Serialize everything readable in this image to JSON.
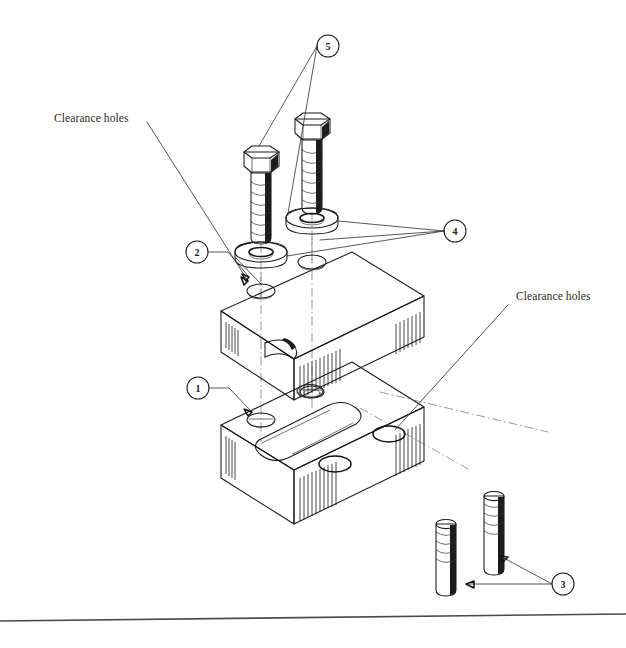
{
  "drawing": {
    "title": "Exploded isometric assembly drawing",
    "canvas": {
      "width": 626,
      "height": 648
    },
    "background_color": "#ffffff",
    "line_color": "#1a1a1a",
    "annotations": [
      {
        "id": "clearance-holes-left",
        "text": "Clearance holes",
        "x": 54,
        "y": 122
      },
      {
        "id": "clearance-holes-right",
        "text": "Clearance holes",
        "x": 516,
        "y": 300
      }
    ],
    "balloons": [
      {
        "id": "balloon-1",
        "label": "1",
        "cx": 198,
        "cy": 388,
        "r": 11,
        "part": "lower-block"
      },
      {
        "id": "balloon-2",
        "label": "2",
        "cx": 197,
        "cy": 252,
        "r": 11,
        "part": "upper-block"
      },
      {
        "id": "balloon-3",
        "label": "3",
        "cx": 563,
        "cy": 584,
        "r": 11,
        "part": "studs"
      },
      {
        "id": "balloon-4",
        "label": "4",
        "cx": 455,
        "cy": 231,
        "r": 11,
        "part": "washers"
      },
      {
        "id": "balloon-5",
        "label": "5",
        "cx": 328,
        "cy": 46,
        "r": 11,
        "part": "hex-bolts"
      }
    ],
    "parts": [
      {
        "item": "1",
        "name": "Lower block",
        "qty": 1
      },
      {
        "item": "2",
        "name": "Upper block",
        "qty": 1
      },
      {
        "item": "3",
        "name": "Threaded stud",
        "qty": 2
      },
      {
        "item": "4",
        "name": "Flat washer",
        "qty": 2
      },
      {
        "item": "5",
        "name": "Hex head bolt",
        "qty": 2
      }
    ],
    "footer_rule": {
      "x1": 0,
      "y1": 621,
      "x2": 626,
      "y2": 614
    }
  }
}
